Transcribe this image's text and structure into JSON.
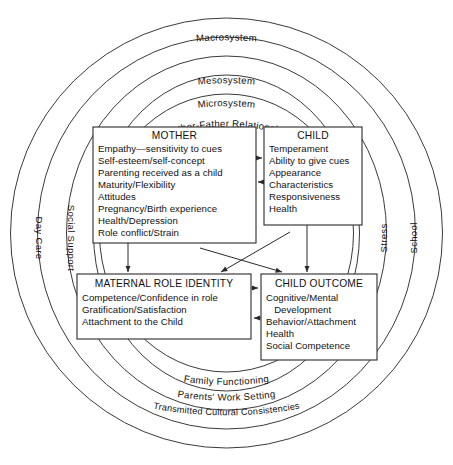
{
  "figure": {
    "background_color": "#ffffff",
    "line_color": "#2a2a2a"
  },
  "rings": [
    {
      "id": "macrosystem",
      "label": "Macrosystem"
    },
    {
      "id": "mesosystem",
      "label": "Mesosystem"
    },
    {
      "id": "microsystem",
      "label": "Microsystem"
    },
    {
      "id": "mother-father",
      "label": "Mother-Father Relationship"
    },
    {
      "id": "family",
      "label": "Family Functioning"
    },
    {
      "id": "work",
      "label": "Parents' Work Setting"
    },
    {
      "id": "culture",
      "label": "Transmitted Cultural Consistencies"
    }
  ],
  "side_labels": {
    "outer_left": "Day Care",
    "inner_left": "Social Support",
    "inner_right": "Stress",
    "outer_right": "School"
  },
  "boxes": {
    "mother": {
      "title": "MOTHER",
      "items": [
        "Empathy—sensitivity to cues",
        "Self-esteem/self-concept",
        "Parenting received as a child",
        "Maturity/Flexibility",
        "Attitudes",
        "Pregnancy/Birth experience",
        "Health/Depression",
        "Role conflict/Strain"
      ]
    },
    "child": {
      "title": "CHILD",
      "items": [
        "Temperament",
        "Ability to give cues",
        "Appearance",
        "Characteristics",
        "Responsiveness",
        "Health"
      ]
    },
    "maternal_role_identity": {
      "title": "MATERNAL ROLE IDENTITY",
      "items": [
        "Competence/Confidence in role",
        "Gratification/Satisfaction",
        "Attachment to the Child"
      ]
    },
    "child_outcome": {
      "title": "CHILD OUTCOME",
      "items": [
        "Cognitive/Mental",
        "   Development",
        "Behavior/Attachment",
        "Health",
        "Social Competence"
      ]
    }
  }
}
